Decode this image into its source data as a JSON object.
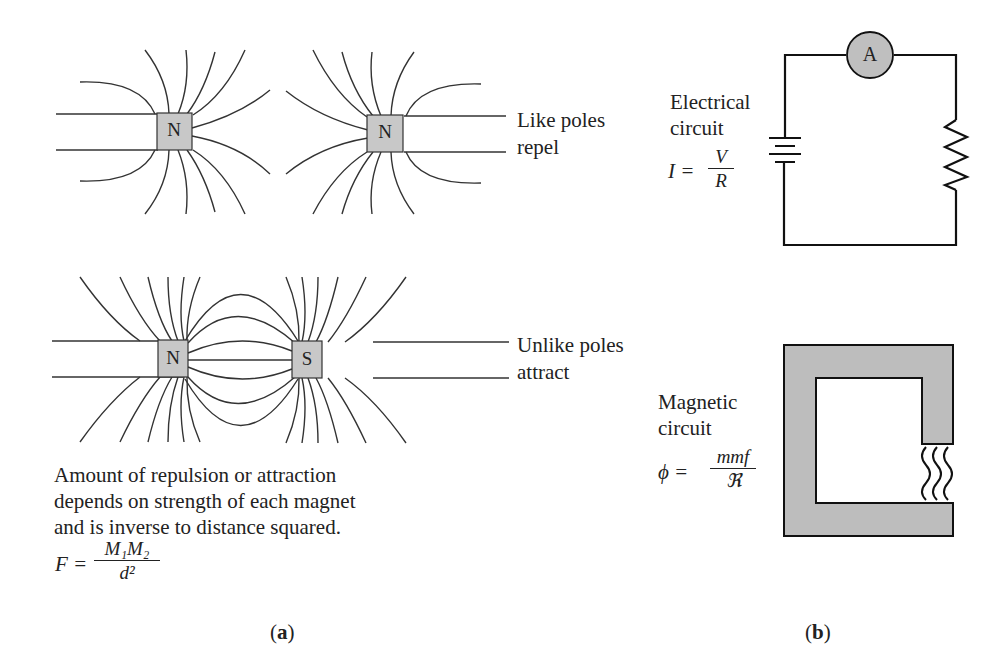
{
  "panel_a": {
    "like_poles": {
      "magnet_left_label": "N",
      "magnet_right_label": "N",
      "caption_line1": "Like poles",
      "caption_line2": "repel"
    },
    "unlike_poles": {
      "magnet_left_label": "N",
      "magnet_right_label": "S",
      "caption_line1": "Unlike poles",
      "caption_line2": "attract"
    },
    "description": [
      "Amount of repulsion or attraction",
      "depends on strength of each magnet",
      "and is inverse to distance squared."
    ],
    "formula": {
      "lhs": "F =",
      "numerator": "M₁M₂",
      "denominator": "d²"
    },
    "label": "a"
  },
  "panel_b": {
    "electrical": {
      "title_line1": "Electrical",
      "title_line2": "circuit",
      "formula_lhs": "I =",
      "numerator": "V",
      "denominator": "R",
      "ammeter_label": "A"
    },
    "magnetic": {
      "title_line1": "Magnetic",
      "title_line2": "circuit",
      "formula_lhs": "ϕ =",
      "numerator": "mmf",
      "denominator": "ℜ"
    },
    "label": "b"
  },
  "colors": {
    "line": "#333333",
    "magnet_fill": "#c8c8c8",
    "core_fill": "#bdbdbd",
    "ammeter_fill": "#bfbfbf"
  }
}
